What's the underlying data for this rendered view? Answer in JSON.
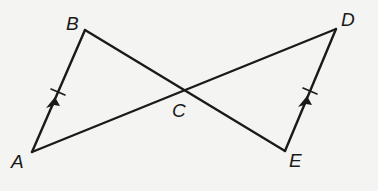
{
  "figure": {
    "type": "geometry-diagram",
    "colors": {
      "stroke": "#1a1a1a",
      "background": "#f4f4f2"
    },
    "points": [
      {
        "name": "A",
        "label": "A",
        "x": 32,
        "y": 152
      },
      {
        "name": "B",
        "label": "B",
        "x": 85,
        "y": 30
      },
      {
        "name": "C",
        "label": "C",
        "x": 183,
        "y": 91
      },
      {
        "name": "D",
        "label": "D",
        "x": 336,
        "y": 29
      },
      {
        "name": "E",
        "label": "E",
        "x": 285,
        "y": 151
      }
    ],
    "segments": [
      {
        "from": "A",
        "to": "B",
        "marks": [
          "single-tick",
          "single-arrow"
        ]
      },
      {
        "from": "B",
        "to": "E",
        "marks": []
      },
      {
        "from": "A",
        "to": "D",
        "marks": []
      },
      {
        "from": "E",
        "to": "D",
        "marks": [
          "single-tick",
          "single-arrow"
        ]
      }
    ],
    "markings": {
      "congruent": [
        "AB",
        "ED"
      ],
      "parallel": [
        "AB",
        "ED"
      ]
    }
  }
}
